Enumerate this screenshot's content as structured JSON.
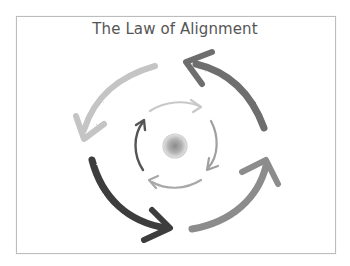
{
  "diagram": {
    "title": "The Law of Alignment",
    "center": {
      "label": "core",
      "color": "#9a9a9a"
    },
    "outer_arrows": [
      {
        "position": "top-left",
        "direction": "counterclockwise",
        "color": "#c4c4c4"
      },
      {
        "position": "top-right",
        "direction": "counterclockwise",
        "color": "#6e6e6e"
      },
      {
        "position": "bottom-right",
        "direction": "counterclockwise",
        "color": "#8c8c8c"
      },
      {
        "position": "bottom-left",
        "direction": "counterclockwise",
        "color": "#3c3c3c"
      }
    ],
    "inner_arrows": [
      {
        "position": "top",
        "direction": "clockwise",
        "color": "#c8c8c8"
      },
      {
        "position": "right",
        "direction": "clockwise",
        "color": "#a0a0a0"
      },
      {
        "position": "bottom",
        "direction": "clockwise",
        "color": "#a8a8a8"
      },
      {
        "position": "left",
        "direction": "clockwise",
        "color": "#555555"
      }
    ],
    "frame_border_color": "#bcbcbc"
  }
}
